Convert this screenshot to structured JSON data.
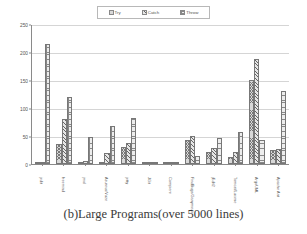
{
  "caption": "(b)Large Programs(over 5000 lines)",
  "legend": {
    "items": [
      {
        "label": "Try",
        "pattern": "pat-try"
      },
      {
        "label": "Catch",
        "pattern": "pat-catch"
      },
      {
        "label": "Throw",
        "pattern": "pat-throw"
      }
    ]
  },
  "chart_data": {
    "type": "bar",
    "title": "(b)Large Programs(over 5000 lines)",
    "xlabel": "",
    "ylabel": "",
    "ylim": [
      0,
      250
    ],
    "yticks": [
      0,
      50,
      100,
      150,
      200,
      250
    ],
    "grid": true,
    "legend_position": "top-center",
    "categories": [
      "jedit",
      "freemind",
      "jmol",
      "Azureus/Vuze",
      "jetty",
      "JGit",
      "Compiere",
      "FindBugs/Ganymede",
      "jEdit2",
      "Tomcat/Lucene",
      "ArgoUML",
      "Apache Ant"
    ],
    "series": [
      {
        "name": "Try",
        "values": [
          2,
          35,
          2,
          2,
          30,
          1,
          2,
          42,
          22,
          12,
          150,
          25
        ]
      },
      {
        "name": "Catch",
        "values": [
          2,
          80,
          5,
          20,
          38,
          1,
          2,
          50,
          28,
          22,
          188,
          27
        ]
      },
      {
        "name": "Throw",
        "values": [
          215,
          120,
          48,
          68,
          82,
          1,
          3,
          15,
          47,
          58,
          42,
          130
        ]
      }
    ],
    "extra_note": ""
  }
}
